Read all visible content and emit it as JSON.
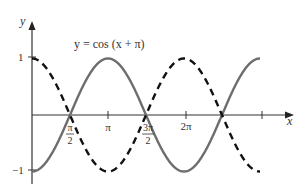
{
  "chart_data": {
    "type": "line",
    "title": "",
    "annotation": "y = cos (x + π)",
    "xlabel": "x",
    "ylabel": "y",
    "xlim": [
      0,
      3.14159
    ],
    "ylim": [
      -1,
      1
    ],
    "x_ticks": [
      {
        "value": 1.5708,
        "label_num": "π",
        "label_den": "2"
      },
      {
        "value": 3.14159,
        "label": "π"
      },
      {
        "value": 4.71239,
        "label_num": "3π",
        "label_den": "2"
      },
      {
        "value": 6.28319,
        "label": "2π"
      },
      {
        "value": 9.42478,
        "label": ""
      }
    ],
    "y_ticks": [
      {
        "value": 1,
        "label": "1"
      },
      {
        "value": -1,
        "label": "−1"
      }
    ],
    "x_range": [
      0,
      9.42478
    ],
    "series": [
      {
        "name": "cos(x)",
        "style": "dashed",
        "color": "#000000",
        "function": "cos(x)"
      },
      {
        "name": "y = cos (x + π)",
        "style": "solid",
        "color": "#6d6d6d",
        "function": "cos(x+pi)"
      }
    ],
    "grid": false,
    "legend": "none"
  },
  "labels": {
    "annotation": "y = cos (x + π)",
    "x_axis": "x",
    "y_axis": "y",
    "y_one": "1",
    "y_neg_one": "−1",
    "pi_half_num": "π",
    "pi_half_den": "2",
    "pi": "π",
    "three_pi_half_num": "3π",
    "three_pi_half_den": "2",
    "two_pi": "2π"
  }
}
